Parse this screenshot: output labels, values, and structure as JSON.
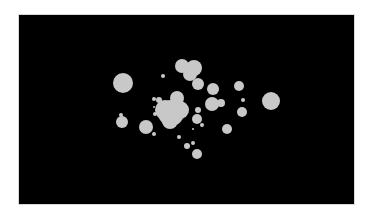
{
  "image": {
    "background": "#ffffff",
    "panel_color": "#000000",
    "blob_color": "#c8c8c8",
    "panel": {
      "x": 19,
      "y": 15,
      "w": 335,
      "h": 189
    }
  },
  "blobs": [
    {
      "x": 123,
      "y": 83,
      "r": 10
    },
    {
      "x": 182,
      "y": 66,
      "r": 7
    },
    {
      "x": 194,
      "y": 68,
      "r": 8
    },
    {
      "x": 190,
      "y": 74,
      "r": 7
    },
    {
      "x": 198,
      "y": 84,
      "r": 6
    },
    {
      "x": 163,
      "y": 76,
      "r": 2
    },
    {
      "x": 213,
      "y": 89,
      "r": 6
    },
    {
      "x": 239,
      "y": 86,
      "r": 5
    },
    {
      "x": 271,
      "y": 101,
      "r": 9
    },
    {
      "x": 243,
      "y": 100,
      "r": 2
    },
    {
      "x": 242,
      "y": 112,
      "r": 5
    },
    {
      "x": 212,
      "y": 104,
      "r": 7
    },
    {
      "x": 221,
      "y": 103,
      "r": 4
    },
    {
      "x": 177,
      "y": 98,
      "r": 7
    },
    {
      "x": 171,
      "y": 113,
      "r": 13
    },
    {
      "x": 165,
      "y": 110,
      "r": 10
    },
    {
      "x": 180,
      "y": 110,
      "r": 9
    },
    {
      "x": 170,
      "y": 121,
      "r": 8
    },
    {
      "x": 159,
      "y": 100,
      "r": 3
    },
    {
      "x": 154,
      "y": 99,
      "r": 2
    },
    {
      "x": 155,
      "y": 114,
      "r": 2
    },
    {
      "x": 154,
      "y": 107,
      "r": 1
    },
    {
      "x": 198,
      "y": 110,
      "r": 3
    },
    {
      "x": 197,
      "y": 119,
      "r": 5
    },
    {
      "x": 202,
      "y": 125,
      "r": 2
    },
    {
      "x": 193,
      "y": 129,
      "r": 1
    },
    {
      "x": 122,
      "y": 122,
      "r": 6
    },
    {
      "x": 121,
      "y": 115,
      "r": 2
    },
    {
      "x": 146,
      "y": 127,
      "r": 7
    },
    {
      "x": 154,
      "y": 134,
      "r": 2
    },
    {
      "x": 227,
      "y": 129,
      "r": 5
    },
    {
      "x": 179,
      "y": 137,
      "r": 2
    },
    {
      "x": 187,
      "y": 146,
      "r": 3
    },
    {
      "x": 193,
      "y": 143,
      "r": 2
    },
    {
      "x": 197,
      "y": 154,
      "r": 5
    }
  ]
}
